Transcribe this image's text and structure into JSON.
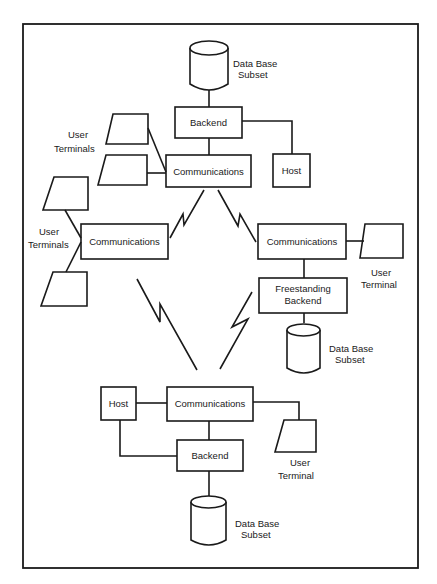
{
  "diagram": {
    "type": "distributed-database-network",
    "nodes": {
      "top": {
        "database": "Data Base Subset",
        "database_l1": "Data Base",
        "database_l2": "Subset",
        "backend": "Backend",
        "communications": "Communications",
        "host": "Host",
        "terminals_l1": "User",
        "terminals_l2": "Terminals"
      },
      "left": {
        "communications": "Communications",
        "terminals_l1": "User",
        "terminals_l2": "Terminals"
      },
      "right": {
        "communications": "Communications",
        "backend_l1": "Freestanding",
        "backend_l2": "Backend",
        "terminal_l1": "User",
        "terminal_l2": "Terminal",
        "database_l1": "Data Base",
        "database_l2": "Subset"
      },
      "bottom": {
        "host": "Host",
        "communications": "Communications",
        "backend": "Backend",
        "terminal_l1": "User",
        "terminal_l2": "Terminal",
        "database_l1": "Data Base",
        "database_l2": "Subset"
      }
    },
    "links": [
      {
        "from": "top.communications",
        "to": "left.communications",
        "kind": "telecom"
      },
      {
        "from": "top.communications",
        "to": "right.communications",
        "kind": "telecom"
      },
      {
        "from": "left.communications",
        "to": "bottom.communications",
        "kind": "telecom"
      },
      {
        "from": "right.communications",
        "to": "bottom.communications",
        "kind": "telecom"
      }
    ]
  }
}
